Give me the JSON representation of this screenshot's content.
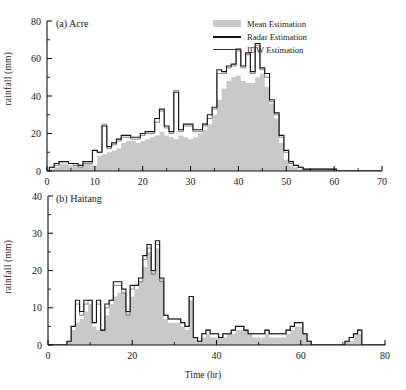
{
  "figure": {
    "ylabel": "rainfall (mm)",
    "xlabel": "Time (hr)"
  },
  "legend": {
    "position": "top-right",
    "items": [
      {
        "label": "Mean Estimation",
        "symbol": "filled-swatch",
        "color": "#c9c9c9"
      },
      {
        "label": "Radar Estimation",
        "symbol": "thick-line",
        "color": "#111111"
      },
      {
        "label": "IDW Estimation",
        "symbol": "thin-line",
        "color": "#333333"
      }
    ]
  },
  "panel_a": {
    "title": "(a) Acre",
    "xticks": [
      "0",
      "10",
      "20",
      "30",
      "40",
      "50",
      "60",
      "70"
    ],
    "yticks": [
      "0",
      "20",
      "40",
      "60",
      "80"
    ]
  },
  "panel_b": {
    "title": "(b) Haitang",
    "xticks": [
      "0",
      "20",
      "40",
      "60",
      "80"
    ],
    "yticks": [
      "0",
      "10",
      "20",
      "30",
      "40"
    ]
  },
  "chart_data": [
    {
      "type": "area",
      "panel": "a",
      "title": "(a) Acre",
      "xlabel": "",
      "ylabel": "rainfall (mm)",
      "xlim": [
        0,
        70
      ],
      "ylim": [
        0,
        80
      ],
      "xticks": [
        0,
        10,
        20,
        30,
        40,
        50,
        60,
        70
      ],
      "yticks": [
        0,
        20,
        40,
        60,
        80
      ],
      "grid": false,
      "x": [
        0,
        1,
        2,
        3,
        4,
        5,
        6,
        7,
        8,
        9,
        10,
        11,
        12,
        13,
        14,
        15,
        16,
        17,
        18,
        19,
        20,
        21,
        22,
        23,
        24,
        25,
        26,
        27,
        28,
        29,
        30,
        31,
        32,
        33,
        34,
        35,
        36,
        37,
        38,
        39,
        40,
        41,
        42,
        43,
        44,
        45,
        46,
        47,
        48,
        49,
        50,
        51,
        52,
        53,
        54,
        55,
        56,
        57,
        58,
        59,
        60,
        61,
        62,
        63,
        64,
        65,
        66,
        67,
        68,
        69,
        70
      ],
      "series": [
        {
          "name": "Mean Estimation",
          "style": "filled-step",
          "values": [
            0,
            1,
            2,
            4,
            4,
            3,
            3,
            2,
            4,
            4,
            3,
            8,
            9,
            10,
            11,
            12,
            15,
            16,
            16,
            15,
            16,
            17,
            18,
            19,
            21,
            19,
            18,
            17,
            19,
            18,
            17,
            18,
            20,
            22,
            25,
            30,
            38,
            44,
            48,
            50,
            51,
            48,
            47,
            47,
            50,
            52,
            45,
            36,
            28,
            15,
            6,
            3,
            2,
            1,
            1,
            1,
            1,
            1,
            1,
            1,
            1,
            0,
            0,
            0,
            0,
            0,
            0,
            0,
            0,
            0,
            0
          ]
        },
        {
          "name": "Radar Estimation",
          "style": "thick-step",
          "values": [
            0,
            2,
            4,
            5,
            5,
            4,
            4,
            3,
            5,
            5,
            11,
            10,
            24,
            13,
            15,
            17,
            19,
            19,
            18,
            18,
            20,
            21,
            21,
            28,
            33,
            24,
            21,
            42,
            22,
            25,
            25,
            22,
            22,
            25,
            30,
            34,
            54,
            53,
            56,
            57,
            65,
            56,
            63,
            53,
            68,
            55,
            52,
            38,
            31,
            19,
            11,
            5,
            3,
            2,
            1,
            1,
            1,
            1,
            1,
            1,
            1,
            0,
            0,
            0,
            0,
            0,
            0,
            0,
            0,
            0,
            0
          ]
        },
        {
          "name": "IDW Estimation",
          "style": "thin-step",
          "values": [
            0,
            2,
            3,
            5,
            5,
            4,
            3,
            2,
            4,
            4,
            11,
            10,
            25,
            12,
            14,
            16,
            18,
            18,
            17,
            17,
            19,
            20,
            20,
            26,
            32,
            23,
            20,
            43,
            21,
            24,
            24,
            21,
            21,
            24,
            28,
            33,
            52,
            52,
            55,
            56,
            64,
            55,
            62,
            52,
            67,
            54,
            50,
            37,
            30,
            18,
            10,
            4,
            3,
            2,
            1,
            1,
            1,
            1,
            1,
            1,
            1,
            0,
            0,
            0,
            0,
            0,
            0,
            0,
            0,
            0,
            0
          ]
        }
      ]
    },
    {
      "type": "area",
      "panel": "b",
      "title": "(b) Haitang",
      "xlabel": "Time (hr)",
      "ylabel": "rainfall (mm)",
      "xlim": [
        0,
        80
      ],
      "ylim": [
        0,
        40
      ],
      "xticks": [
        0,
        20,
        40,
        60,
        80
      ],
      "yticks": [
        0,
        10,
        20,
        30,
        40
      ],
      "grid": false,
      "x": [
        0,
        1,
        2,
        3,
        4,
        5,
        6,
        7,
        8,
        9,
        10,
        11,
        12,
        13,
        14,
        15,
        16,
        17,
        18,
        19,
        20,
        21,
        22,
        23,
        24,
        25,
        26,
        27,
        28,
        29,
        30,
        31,
        32,
        33,
        34,
        35,
        36,
        37,
        38,
        39,
        40,
        41,
        42,
        43,
        44,
        45,
        46,
        47,
        48,
        49,
        50,
        51,
        52,
        53,
        54,
        55,
        56,
        57,
        58,
        59,
        60,
        61,
        62,
        63,
        64,
        65,
        66,
        67,
        68,
        69,
        70,
        71,
        72,
        73,
        74,
        75,
        76,
        77,
        78,
        79,
        80
      ],
      "series": [
        {
          "name": "Mean Estimation",
          "style": "filled-step",
          "values": [
            0,
            0,
            0,
            0,
            0,
            1,
            4,
            6,
            7,
            9,
            11,
            5,
            4,
            4,
            8,
            11,
            13,
            14,
            14,
            9,
            13,
            15,
            17,
            21,
            25,
            20,
            26,
            18,
            7,
            6,
            6,
            6,
            5,
            4,
            12,
            2,
            1,
            2,
            3,
            2,
            2,
            2,
            2,
            3,
            3,
            4,
            4,
            4,
            3,
            2,
            2,
            2,
            3,
            2,
            2,
            2,
            2,
            3,
            4,
            5,
            5,
            3,
            1,
            0,
            0,
            0,
            0,
            0,
            0,
            0,
            0,
            1,
            1,
            3,
            3,
            0,
            0,
            0,
            0,
            0,
            0
          ]
        },
        {
          "name": "Radar Estimation",
          "style": "thick-step",
          "values": [
            0,
            0,
            0,
            0,
            0,
            1,
            5,
            12,
            9,
            12,
            12,
            6,
            12,
            4,
            11,
            12,
            17,
            17,
            15,
            9,
            16,
            16,
            18,
            24,
            27,
            20,
            28,
            18,
            8,
            7,
            7,
            7,
            6,
            5,
            13,
            2,
            1,
            3,
            4,
            3,
            3,
            2,
            3,
            3,
            4,
            5,
            5,
            4,
            3,
            3,
            3,
            3,
            4,
            3,
            3,
            3,
            3,
            4,
            5,
            6,
            6,
            3,
            1,
            0,
            0,
            0,
            0,
            0,
            0,
            0,
            0,
            1,
            2,
            3,
            4,
            0,
            0,
            0,
            0,
            0,
            0
          ]
        },
        {
          "name": "IDW Estimation",
          "style": "thin-step",
          "values": [
            0,
            0,
            0,
            0,
            0,
            1,
            5,
            11,
            8,
            11,
            12,
            6,
            11,
            4,
            10,
            12,
            16,
            16,
            14,
            8,
            15,
            16,
            17,
            23,
            26,
            19,
            27,
            17,
            8,
            7,
            7,
            7,
            6,
            5,
            13,
            2,
            1,
            3,
            4,
            3,
            3,
            2,
            3,
            3,
            4,
            5,
            5,
            4,
            3,
            3,
            3,
            3,
            4,
            3,
            3,
            3,
            3,
            4,
            5,
            6,
            6,
            3,
            1,
            0,
            0,
            0,
            0,
            0,
            0,
            0,
            0,
            1,
            2,
            3,
            4,
            0,
            0,
            0,
            0,
            0,
            0
          ]
        }
      ]
    }
  ]
}
